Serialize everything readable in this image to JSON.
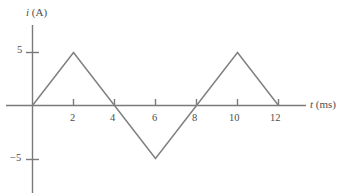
{
  "chart_data": {
    "type": "line",
    "title": "",
    "subtitle": "",
    "xlabel": "t (ms)",
    "xlabel_symbol": "t",
    "xlabel_unit": "(ms)",
    "ylabel": "i (A)",
    "ylabel_symbol": "i",
    "ylabel_unit": "(A)",
    "x": [
      0,
      2,
      4,
      6,
      8,
      10,
      12
    ],
    "values": [
      0,
      5,
      0,
      -5,
      0,
      5,
      0
    ],
    "series": [
      {
        "name": "i(t)",
        "x": [
          0,
          2,
          4,
          6,
          8,
          10,
          12
        ],
        "values": [
          0,
          5,
          0,
          -5,
          0,
          5,
          0
        ]
      }
    ],
    "xlim": [
      0,
      13.5
    ],
    "ylim": [
      -6.5,
      7.0
    ],
    "xticks": [
      2,
      4,
      6,
      8,
      10,
      12
    ],
    "xtick_labels": [
      "2",
      "4",
      "6",
      "8",
      "10",
      "12"
    ],
    "yticks": [
      5,
      -5
    ],
    "ytick_labels": [
      "5",
      "−5"
    ],
    "grid": false,
    "legend": false,
    "waveform": "triangular",
    "period_ms": 8,
    "amplitude_A": 5,
    "line_color": "#808080",
    "axis_color": "#707070",
    "text_color": "#4d4d4d",
    "background_color": "#ffffff"
  },
  "axes": {
    "y_label_symbol": "i",
    "y_label_unit": "(A)",
    "x_label_symbol": "t",
    "x_label_unit": "(ms)",
    "y_tick_top": "5",
    "y_tick_bottom": "−5",
    "x_tick_1": "2",
    "x_tick_2": "4",
    "x_tick_3": "6",
    "x_tick_4": "8",
    "x_tick_5": "10",
    "x_tick_6": "12"
  }
}
